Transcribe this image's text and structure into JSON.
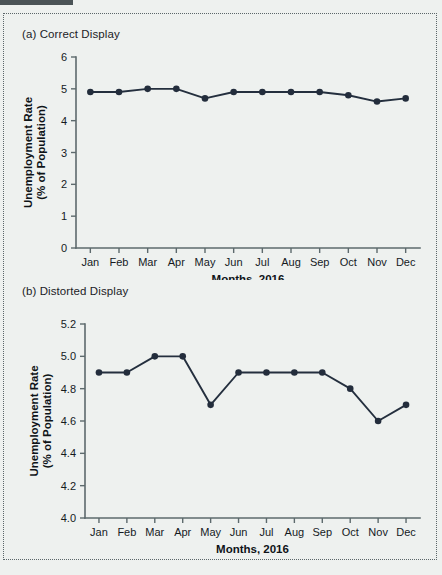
{
  "figure": {
    "background_color": "#eef1ef",
    "line_color": "#242f3e",
    "axis_color": "#5d6a6d",
    "rule_color": "#4b5457"
  },
  "panel_a": {
    "caption": "(a) Correct Display"
  },
  "panel_b": {
    "caption": "(b) Distorted Display"
  },
  "chart_data": [
    {
      "type": "line",
      "title": "(a) Correct Display",
      "xlabel": "Months, 2016",
      "ylabel": "Unemployment Rate\n(% of Population)",
      "ylabel_line1": "Unemployment Rate",
      "ylabel_line2": "(% of Population)",
      "categories": [
        "Jan",
        "Feb",
        "Mar",
        "Apr",
        "May",
        "Jun",
        "Jul",
        "Aug",
        "Sep",
        "Oct",
        "Nov",
        "Dec"
      ],
      "values": [
        4.9,
        4.9,
        5.0,
        5.0,
        4.7,
        4.9,
        4.9,
        4.9,
        4.9,
        4.8,
        4.6,
        4.7
      ],
      "ylim": [
        0,
        6
      ],
      "yticks": [
        0,
        1,
        2,
        3,
        4,
        5,
        6
      ],
      "ytick_labels": [
        "0",
        "1",
        "2",
        "3",
        "4",
        "5",
        "6"
      ],
      "grid": false,
      "legend": false,
      "marker": "circle",
      "series_name": "Unemployment Rate"
    },
    {
      "type": "line",
      "title": "(b) Distorted Display",
      "xlabel": "Months, 2016",
      "ylabel": "Unemployment Rate\n(% of Population)",
      "ylabel_line1": "Unemployment Rate",
      "ylabel_line2": "(% of Population)",
      "categories": [
        "Jan",
        "Feb",
        "Mar",
        "Apr",
        "May",
        "Jun",
        "Jul",
        "Aug",
        "Sep",
        "Oct",
        "Nov",
        "Dec"
      ],
      "values": [
        4.9,
        4.9,
        5.0,
        5.0,
        4.7,
        4.9,
        4.9,
        4.9,
        4.9,
        4.8,
        4.6,
        4.7
      ],
      "ylim": [
        4.0,
        5.2
      ],
      "yticks": [
        4.0,
        4.2,
        4.4,
        4.6,
        4.8,
        5.0,
        5.2
      ],
      "ytick_labels": [
        "4.0",
        "4.2",
        "4.4",
        "4.6",
        "4.8",
        "5.0",
        "5.2"
      ],
      "grid": false,
      "legend": false,
      "marker": "circle",
      "series_name": "Unemployment Rate"
    }
  ]
}
